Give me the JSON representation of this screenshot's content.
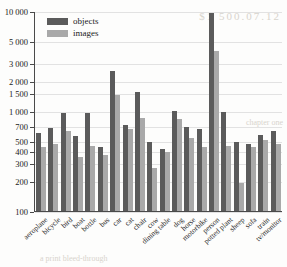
{
  "background_text": {
    "line1": "$1 500.07.12",
    "line2": "chapter one",
    "line3": "a print bleed-through"
  },
  "chart_data": {
    "type": "bar",
    "title": "",
    "xlabel": "",
    "ylabel": "",
    "yscale": "log",
    "ylim": [
      100,
      10000
    ],
    "grid": true,
    "legend_position": "top-left",
    "ytick_labels": [
      "100",
      "200",
      "300",
      "400",
      "500",
      "700",
      "1 000",
      "1 500",
      "2 000",
      "3 000",
      "5 000",
      "10 000"
    ],
    "yticks": [
      100,
      200,
      300,
      400,
      500,
      700,
      1000,
      1500,
      2000,
      3000,
      5000,
      10000
    ],
    "categories": [
      "aeroplane",
      "bicycle",
      "bird",
      "boat",
      "bottle",
      "bus",
      "car",
      "cat",
      "chair",
      "cow",
      "dining table",
      "dog",
      "horse",
      "motorbike",
      "person",
      "potted plant",
      "sheep",
      "sofa",
      "train",
      "tv/monitor"
    ],
    "series": [
      {
        "name": "objects",
        "color": "#5b5b5b",
        "values": [
          600,
          680,
          960,
          560,
          960,
          440,
          2500,
          730,
          1550,
          490,
          420,
          1000,
          700,
          660,
          9600,
          980,
          490,
          470,
          570,
          630
        ]
      },
      {
        "name": "images",
        "color": "#a9a9a9",
        "values": [
          440,
          470,
          630,
          350,
          450,
          360,
          1450,
          660,
          850,
          270,
          390,
          830,
          540,
          440,
          4000,
          450,
          190,
          440,
          510,
          470
        ]
      }
    ]
  }
}
